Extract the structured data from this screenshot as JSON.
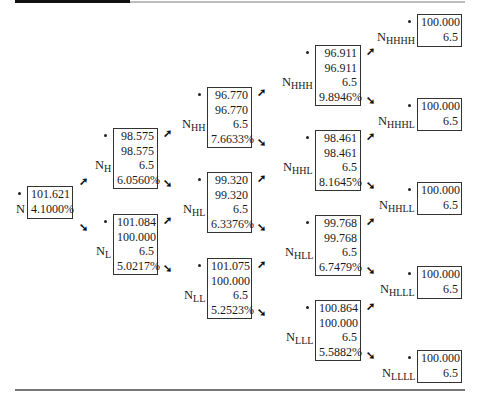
{
  "decorations": {
    "top_bar": true,
    "bottom_rule": true
  },
  "nodes": [
    {
      "id": "N",
      "label": "N",
      "sub": "",
      "rows": [
        "101.621",
        "4.1000%"
      ],
      "x": 27,
      "y": 186,
      "w": 46,
      "h": 33
    },
    {
      "id": "NH",
      "label": "N",
      "sub": "H",
      "rows": [
        "98.575",
        "98.575",
        "6.5",
        "6.0560%"
      ],
      "x": 113,
      "y": 128,
      "w": 45,
      "h": 61
    },
    {
      "id": "NL",
      "label": "N",
      "sub": "L",
      "rows": [
        "101.084",
        "100.000",
        "6.5",
        "5.0217%"
      ],
      "x": 113,
      "y": 214,
      "w": 45,
      "h": 61
    },
    {
      "id": "NHH",
      "label": "N",
      "sub": "HH",
      "rows": [
        "96.770",
        "96.770",
        "6.5",
        "7.6633%"
      ],
      "x": 207,
      "y": 87,
      "w": 45,
      "h": 61
    },
    {
      "id": "NHL",
      "label": "N",
      "sub": "HL",
      "rows": [
        "99.320",
        "99.320",
        "6.5",
        "6.3376%"
      ],
      "x": 207,
      "y": 172,
      "w": 45,
      "h": 61
    },
    {
      "id": "NLL",
      "label": "N",
      "sub": "LL",
      "rows": [
        "101.075",
        "100.000",
        "6.5",
        "5.2523%"
      ],
      "x": 207,
      "y": 258,
      "w": 45,
      "h": 61
    },
    {
      "id": "NHHH",
      "label": "N",
      "sub": "HHH",
      "rows": [
        "96.911",
        "96.911",
        "6.5",
        "9.8946%"
      ],
      "x": 315,
      "y": 45,
      "w": 46,
      "h": 61
    },
    {
      "id": "NHHL",
      "label": "N",
      "sub": "HHL",
      "rows": [
        "98.461",
        "98.461",
        "6.5",
        "8.1645%"
      ],
      "x": 315,
      "y": 130,
      "w": 46,
      "h": 61
    },
    {
      "id": "NHLL",
      "label": "N",
      "sub": "HLL",
      "rows": [
        "99.768",
        "99.768",
        "6.5",
        "6.7479%"
      ],
      "x": 315,
      "y": 215,
      "w": 46,
      "h": 61
    },
    {
      "id": "NLLL",
      "label": "N",
      "sub": "LLL",
      "rows": [
        "100.864",
        "100.000",
        "6.5",
        "5.5882%"
      ],
      "x": 315,
      "y": 300,
      "w": 46,
      "h": 61
    },
    {
      "id": "NHHHH",
      "label": "N",
      "sub": "HHHH",
      "rows": [
        "100.000",
        "6.5"
      ],
      "x": 417,
      "y": 14,
      "w": 45,
      "h": 33
    },
    {
      "id": "NHHHL",
      "label": "N",
      "sub": "HHHL",
      "rows": [
        "100.000",
        "6.5"
      ],
      "x": 417,
      "y": 98,
      "w": 45,
      "h": 33
    },
    {
      "id": "NHHLL",
      "label": "N",
      "sub": "HHLL",
      "rows": [
        "100.000",
        "6.5"
      ],
      "x": 417,
      "y": 182,
      "w": 45,
      "h": 33
    },
    {
      "id": "NHLLL",
      "label": "N",
      "sub": "HLLL",
      "rows": [
        "100.000",
        "6.5"
      ],
      "x": 417,
      "y": 266,
      "w": 45,
      "h": 33
    },
    {
      "id": "NLLLL",
      "label": "N",
      "sub": "LLLL",
      "rows": [
        "100.000",
        "6.5"
      ],
      "x": 417,
      "y": 350,
      "w": 45,
      "h": 33
    }
  ],
  "arrows": [
    {
      "dir": "up",
      "glyph": "➚",
      "x": 79,
      "y": 176
    },
    {
      "dir": "down",
      "glyph": "➘",
      "x": 79,
      "y": 222
    },
    {
      "dir": "up",
      "glyph": "➚",
      "x": 163,
      "y": 128
    },
    {
      "dir": "down",
      "glyph": "➘",
      "x": 163,
      "y": 178
    },
    {
      "dir": "up",
      "glyph": "➚",
      "x": 163,
      "y": 215
    },
    {
      "dir": "down",
      "glyph": "➘",
      "x": 163,
      "y": 263
    },
    {
      "dir": "up",
      "glyph": "➚",
      "x": 257,
      "y": 87
    },
    {
      "dir": "down",
      "glyph": "➘",
      "x": 257,
      "y": 137
    },
    {
      "dir": "up",
      "glyph": "➚",
      "x": 257,
      "y": 173
    },
    {
      "dir": "down",
      "glyph": "➘",
      "x": 257,
      "y": 222
    },
    {
      "dir": "up",
      "glyph": "➚",
      "x": 257,
      "y": 259
    },
    {
      "dir": "down",
      "glyph": "➘",
      "x": 257,
      "y": 307
    },
    {
      "dir": "up",
      "glyph": "➚",
      "x": 366,
      "y": 46
    },
    {
      "dir": "down",
      "glyph": "➘",
      "x": 366,
      "y": 95
    },
    {
      "dir": "up",
      "glyph": "➚",
      "x": 366,
      "y": 131
    },
    {
      "dir": "down",
      "glyph": "➘",
      "x": 366,
      "y": 180
    },
    {
      "dir": "up",
      "glyph": "➚",
      "x": 366,
      "y": 216
    },
    {
      "dir": "down",
      "glyph": "➘",
      "x": 366,
      "y": 265
    },
    {
      "dir": "up",
      "glyph": "➚",
      "x": 366,
      "y": 301
    },
    {
      "dir": "down",
      "glyph": "➘",
      "x": 366,
      "y": 350
    }
  ]
}
